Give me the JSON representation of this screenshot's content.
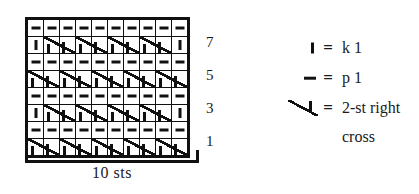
{
  "chart_data": {
    "type": "table",
    "width_label": "10 sts",
    "stitch_count": 10,
    "row_count": 8,
    "row_labels": [
      "7",
      "5",
      "3",
      "1"
    ],
    "row_label_rows": [
      7,
      5,
      3,
      1
    ],
    "symbols": {
      "knit": "I",
      "purl": "-",
      "cross_left": "cross-left-half",
      "cross_right": "cross-right-half"
    },
    "grid": [
      {
        "row": 8,
        "cells": [
          "purl",
          "purl",
          "purl",
          "purl",
          "purl",
          "purl",
          "purl",
          "purl",
          "purl",
          "purl"
        ]
      },
      {
        "row": 7,
        "cells": [
          "knit",
          "crossL",
          "crossR",
          "crossL",
          "crossR",
          "crossL",
          "crossR",
          "crossL",
          "crossR",
          "knit"
        ]
      },
      {
        "row": 6,
        "cells": [
          "purl",
          "purl",
          "purl",
          "purl",
          "purl",
          "purl",
          "purl",
          "purl",
          "purl",
          "purl"
        ]
      },
      {
        "row": 5,
        "cells": [
          "crossL",
          "crossR",
          "crossL",
          "crossR",
          "crossL",
          "crossR",
          "crossL",
          "crossR",
          "crossL",
          "crossR"
        ]
      },
      {
        "row": 4,
        "cells": [
          "purl",
          "purl",
          "purl",
          "purl",
          "purl",
          "purl",
          "purl",
          "purl",
          "purl",
          "purl"
        ]
      },
      {
        "row": 3,
        "cells": [
          "knit",
          "crossL",
          "crossR",
          "crossL",
          "crossR",
          "crossL",
          "crossR",
          "crossL",
          "crossR",
          "knit"
        ]
      },
      {
        "row": 2,
        "cells": [
          "purl",
          "purl",
          "purl",
          "purl",
          "purl",
          "purl",
          "purl",
          "purl",
          "purl",
          "purl"
        ]
      },
      {
        "row": 1,
        "cells": [
          "crossL",
          "crossR",
          "crossL",
          "crossR",
          "crossL",
          "crossR",
          "crossL",
          "crossR",
          "crossL",
          "crossR"
        ]
      }
    ]
  },
  "legend": {
    "entries": [
      {
        "symbol": "knit",
        "equals": "=",
        "label": "k 1",
        "label_cont": ""
      },
      {
        "symbol": "purl",
        "equals": "=",
        "label": "p 1",
        "label_cont": ""
      },
      {
        "symbol": "cross",
        "equals": "=",
        "label": "2-st right",
        "label_cont": "cross"
      }
    ]
  },
  "colors": {
    "ink": "#111111",
    "paper": "#ffffff"
  }
}
